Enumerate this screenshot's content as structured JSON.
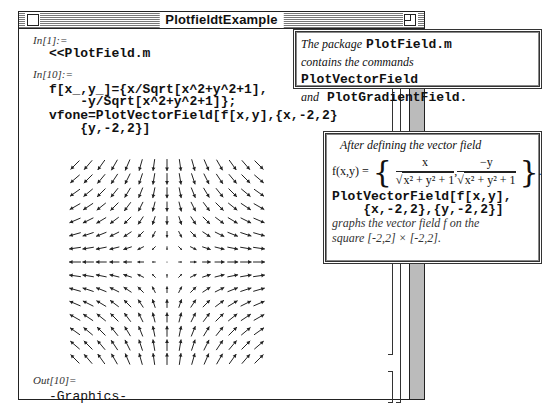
{
  "window": {
    "title": "PlotfieldtExample"
  },
  "cells": [
    {
      "label": "In[1]:=",
      "code": [
        "<<PlotField.m"
      ]
    },
    {
      "label": "In[10]:=",
      "code": [
        "f[x_,y_]={x/Sqrt[x^2+y^2+1],",
        "    -y/Sqrt[x^2+y^2+1]};",
        "vfone=PlotVectorField[f[x,y],{x,-2,2}",
        "    {y,-2,2}]"
      ]
    },
    {
      "label": "Out[10]=",
      "code": [
        "-Graphics-"
      ]
    }
  ],
  "callouts": {
    "package": {
      "line1_italic": "The package",
      "line1_code": "PlotField.m",
      "line2_italic": "contains the commands",
      "line2_code": "PlotVectorField",
      "line3_italic": "and",
      "line3_code": "PlotGradientField."
    },
    "definition": {
      "intro": "After defining the vector field",
      "fx_label": "f(x,y) =",
      "num1": "x",
      "num2": "−y",
      "den": "x² + y² + 1",
      "code1": "PlotVectorField[f[x,y],",
      "code2": "    {x,-2,2},{y,-2,2}]",
      "outro1": "graphs the vector field f on the",
      "outro2": "square [-2,2] × [-2,2]."
    }
  },
  "chart_data": {
    "type": "vector-field",
    "function": "f(x,y) = {x/Sqrt[x^2+y^2+1], -y/Sqrt[x^2+y^2+1]}",
    "x_range": [
      -2,
      2
    ],
    "y_range": [
      -2,
      2
    ],
    "grid_points_per_axis": 15,
    "axes": false
  }
}
